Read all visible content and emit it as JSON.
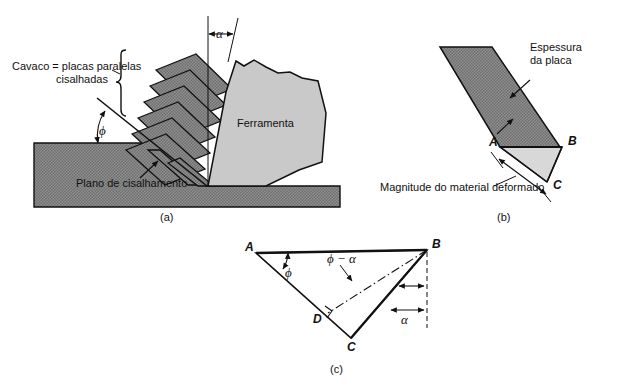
{
  "figure": {
    "background_color": "#ffffff",
    "ink_color": "#111111",
    "chip_fill": "#8a8a8a",
    "tool_fill": "#c9c9c9",
    "deformed_fill": "#d8d8d8",
    "workpiece_fill": "#8a8a8a"
  },
  "panels": {
    "a": {
      "caption": "(a)",
      "labels": {
        "chip": "Cavaco = placas paralelas",
        "chip_line2": "cisalhadas",
        "tool": "Ferramenta",
        "shear_plane": "Plano de cisalhamento",
        "angle_alpha": "α",
        "angle_phi": "ϕ"
      },
      "lamellae_count": 8
    },
    "b": {
      "caption": "(b)",
      "labels": {
        "thickness": "Espessura",
        "thickness_line2": "da placa",
        "deformed": "Magnitude do material deformado",
        "point_a": "A",
        "point_b": "B",
        "point_c": "C"
      }
    },
    "c": {
      "caption": "(c)",
      "labels": {
        "point_a": "A",
        "point_b": "B",
        "point_c": "C",
        "point_d": "D",
        "angle_phi": "ϕ",
        "angle_phi_minus_alpha": "ϕ − α",
        "angle_alpha": "α"
      }
    }
  }
}
